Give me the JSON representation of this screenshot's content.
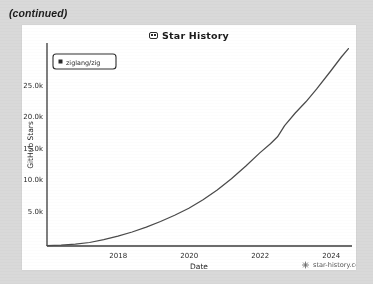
{
  "page": {
    "continued_label": "(continued)",
    "background_color": "#d9d9d9",
    "card_color": "#fdfdfd"
  },
  "card": {
    "title": "Star History",
    "title_icon": "star-history-logo-icon",
    "watermark": "star-history.com",
    "watermark_icon": "starburst-icon"
  },
  "chart_data": {
    "type": "line",
    "title": "Star History",
    "xlabel": "Date",
    "ylabel": "GitHub Stars",
    "grid": false,
    "legend_position": "top-left",
    "line_color": "#4a4a4a",
    "xlim": [
      2016.0,
      2024.6
    ],
    "ylim": [
      0,
      29000
    ],
    "xticks": [
      "2018",
      "2020",
      "2022",
      "2024"
    ],
    "xtick_values": [
      2018,
      2020,
      2022,
      2024
    ],
    "yticks": [
      "5.0k",
      "10.0k",
      "15.0k",
      "20.0k",
      "25.0k"
    ],
    "ytick_values": [
      5000,
      10000,
      15000,
      20000,
      25000
    ],
    "series": [
      {
        "name": "ziglang/zig",
        "marker_color": "#2b2b2b",
        "x": [
          2016.0,
          2016.4,
          2016.8,
          2017.2,
          2017.6,
          2018.0,
          2018.4,
          2018.8,
          2019.2,
          2019.6,
          2020.0,
          2020.4,
          2020.8,
          2021.2,
          2021.6,
          2022.0,
          2022.3,
          2022.5,
          2022.7,
          2023.0,
          2023.3,
          2023.6,
          2024.0,
          2024.3,
          2024.5
        ],
        "values": [
          60,
          120,
          260,
          500,
          900,
          1400,
          2000,
          2700,
          3500,
          4400,
          5400,
          6600,
          8000,
          9600,
          11400,
          13300,
          14600,
          15600,
          17200,
          19000,
          20600,
          22400,
          25000,
          27000,
          28200
        ]
      }
    ]
  }
}
